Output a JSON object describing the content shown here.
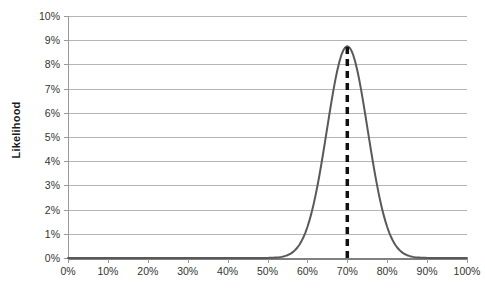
{
  "chart_data": {
    "type": "line",
    "title": "",
    "subtitle": "",
    "xlabel": "",
    "ylabel": "Likelihood",
    "xlim": [
      0,
      100
    ],
    "ylim": [
      0,
      10
    ],
    "grid": true,
    "legend": false,
    "legend_position": "none",
    "x_tick_labels": [
      "0%",
      "10%",
      "20%",
      "30%",
      "40%",
      "50%",
      "60%",
      "70%",
      "80%",
      "90%",
      "100%"
    ],
    "x_ticks": [
      0,
      10,
      20,
      30,
      40,
      50,
      60,
      70,
      80,
      90,
      100
    ],
    "y_tick_labels": [
      "0%",
      "1%",
      "2%",
      "3%",
      "4%",
      "5%",
      "6%",
      "7%",
      "8%",
      "9%",
      "10%"
    ],
    "y_ticks": [
      0,
      1,
      2,
      3,
      4,
      5,
      6,
      7,
      8,
      9,
      10
    ],
    "series": [
      {
        "name": "Likelihood",
        "color": "#595959",
        "line_width": 2,
        "style": "solid",
        "peak_x": 70,
        "peak_y": 8.75,
        "sigma": 5.1,
        "x": [
          0,
          5,
          10,
          15,
          20,
          25,
          30,
          35,
          40,
          42,
          44,
          46,
          48,
          50,
          52,
          54,
          55,
          56,
          57,
          58,
          59,
          60,
          61,
          62,
          63,
          64,
          65,
          66,
          67,
          68,
          69,
          70,
          71,
          72,
          73,
          74,
          75,
          76,
          77,
          78,
          79,
          80,
          81,
          82,
          83,
          84,
          85,
          86,
          88,
          90,
          95,
          100
        ],
        "values": [
          0.0,
          0.0,
          0.0,
          0.0,
          0.0,
          0.0,
          0.0,
          0.0,
          0.01,
          0.01,
          0.02,
          0.03,
          0.04,
          0.06,
          0.09,
          0.14,
          0.18,
          0.23,
          0.3,
          0.39,
          0.5,
          0.65,
          0.84,
          1.08,
          1.38,
          1.76,
          2.22,
          2.78,
          3.44,
          4.22,
          5.1,
          6.06,
          7.05,
          7.98,
          8.55,
          8.75,
          8.55,
          7.98,
          7.05,
          6.06,
          5.1,
          4.22,
          3.44,
          2.78,
          2.22,
          1.76,
          1.38,
          1.08,
          0.65,
          0.39,
          0.09,
          0.01
        ]
      }
    ],
    "annotations": [
      {
        "type": "vertical-line",
        "name": "peak-marker",
        "x": 70,
        "y_from": 0,
        "y_to": 8.75,
        "style": "dashed",
        "color": "#111111",
        "line_width": 3.5,
        "label": ""
      }
    ],
    "colors": {
      "curve": "#595959",
      "marker": "#111111",
      "gridline": "#b5b5b5",
      "axis": "#9a9a9a",
      "baseline": "#808080",
      "text": "#333333",
      "background": "#ffffff"
    }
  }
}
